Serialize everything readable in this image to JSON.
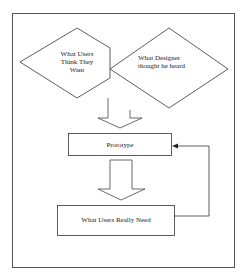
{
  "diagram": {
    "nodes": {
      "users_want": {
        "label_lines": [
          "What Users",
          "Think They",
          "Want"
        ],
        "shape": "diamond"
      },
      "designer_heard": {
        "label_lines": [
          "What Designer",
          "thought he heard"
        ],
        "shape": "diamond"
      },
      "prototype": {
        "label": "Prototype",
        "shape": "rectangle"
      },
      "really_need": {
        "label": "What Users Really Need",
        "shape": "rectangle"
      }
    },
    "edges": [
      {
        "from": "users_want+designer_heard",
        "to": "prototype",
        "style": "hollow-block-arrow"
      },
      {
        "from": "prototype",
        "to": "really_need",
        "style": "hollow-block-arrow"
      },
      {
        "from": "really_need",
        "to": "prototype",
        "style": "feedback-line-arrow"
      }
    ],
    "colors": {
      "line": "#333333",
      "background": "#ffffff"
    }
  }
}
